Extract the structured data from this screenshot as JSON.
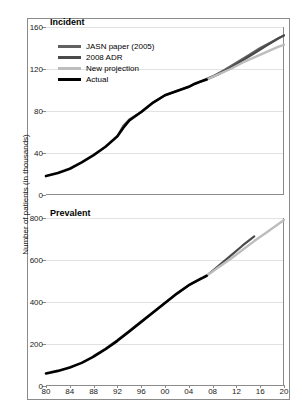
{
  "figure": {
    "ylabel": "Number of patients (in thousands)"
  },
  "legend": {
    "items": [
      {
        "label": "JASN paper (2005)",
        "color": "#616161"
      },
      {
        "label": "2008 ADR",
        "color": "#4a4a4a"
      },
      {
        "label": "New projection",
        "color": "#bdbdbd"
      },
      {
        "label": "Actual",
        "color": "#000000"
      }
    ]
  },
  "chart_data": [
    {
      "type": "line",
      "title": "Incident",
      "xlabel": "",
      "ylabel": "Number of patients (in thousands)",
      "xlim": [
        1980,
        2020
      ],
      "ylim": [
        0,
        160
      ],
      "grid": true,
      "legend_position": "upper-left",
      "xticks": [
        "80",
        "84",
        "88",
        "92",
        "96",
        "00",
        "04",
        "08",
        "12",
        "16",
        "20"
      ],
      "xtick_values": [
        1980,
        1984,
        1988,
        1992,
        1996,
        2000,
        2004,
        2008,
        2012,
        2016,
        2020
      ],
      "yticks": [
        "0",
        "40",
        "80",
        "120",
        "160"
      ],
      "ytick_values": [
        0,
        40,
        80,
        120,
        160
      ],
      "series": [
        {
          "name": "Actual",
          "color": "#000000",
          "width": 2.6,
          "x": [
            1980,
            1982,
            1984,
            1986,
            1988,
            1990,
            1992,
            1993,
            1994,
            1996,
            1998,
            2000,
            2002,
            2004,
            2005,
            2006,
            2007
          ],
          "values": [
            18,
            21,
            25,
            31,
            38,
            46,
            56,
            64,
            71,
            79,
            88,
            95,
            99,
            103,
            106,
            108,
            110
          ]
        },
        {
          "name": "JASN paper (2005)",
          "color": "#616161",
          "width": 2.2,
          "x": [
            1992,
            1993,
            1994,
            1996,
            1998,
            2000,
            2002,
            2004,
            2006,
            2008,
            2010,
            2012,
            2014,
            2016,
            2018,
            2020
          ],
          "values": [
            56,
            66,
            72,
            79,
            88,
            95,
            99,
            103,
            108,
            113,
            119,
            126,
            133,
            140,
            146,
            152
          ]
        },
        {
          "name": "2008 ADR",
          "color": "#4a4a4a",
          "width": 2.2,
          "x": [
            2007,
            2009,
            2011,
            2013,
            2015,
            2017,
            2019,
            2020
          ],
          "values": [
            110,
            115,
            121,
            128,
            135,
            142,
            149,
            152
          ]
        },
        {
          "name": "New projection",
          "color": "#bdbdbd",
          "width": 2.4,
          "x": [
            2007,
            2009,
            2011,
            2013,
            2015,
            2017,
            2019,
            2020
          ],
          "values": [
            110,
            115,
            120,
            126,
            131,
            136,
            141,
            143
          ]
        }
      ]
    },
    {
      "type": "line",
      "title": "Prevalent",
      "xlabel": "",
      "ylabel": "Number of patients (in thousands)",
      "xlim": [
        1980,
        2020
      ],
      "ylim": [
        0,
        800
      ],
      "grid": true,
      "legend_position": "none",
      "xticks": [
        "80",
        "84",
        "88",
        "92",
        "96",
        "00",
        "04",
        "08",
        "12",
        "16",
        "20"
      ],
      "xtick_values": [
        1980,
        1984,
        1988,
        1992,
        1996,
        2000,
        2004,
        2008,
        2012,
        2016,
        2020
      ],
      "yticks": [
        "0",
        "200",
        "400",
        "600",
        "800"
      ],
      "ytick_values": [
        0,
        200,
        400,
        600,
        800
      ],
      "series": [
        {
          "name": "Actual",
          "color": "#000000",
          "width": 2.6,
          "x": [
            1980,
            1982,
            1984,
            1986,
            1988,
            1990,
            1992,
            1994,
            1996,
            1998,
            2000,
            2002,
            2004,
            2006,
            2007
          ],
          "values": [
            60,
            72,
            88,
            110,
            140,
            175,
            215,
            260,
            305,
            350,
            395,
            440,
            480,
            510,
            525
          ]
        },
        {
          "name": "JASN paper (2005)",
          "color": "#616161",
          "width": 2.2,
          "x": [
            1988,
            1990,
            1992,
            1994,
            1996,
            1998,
            2000,
            2002,
            2004,
            2006
          ],
          "values": [
            143,
            178,
            218,
            263,
            308,
            352,
            396,
            440,
            480,
            512
          ]
        },
        {
          "name": "2008 ADR",
          "color": "#4a4a4a",
          "width": 2.2,
          "x": [
            2007,
            2009,
            2011,
            2013,
            2015
          ],
          "values": [
            525,
            572,
            620,
            668,
            712
          ]
        },
        {
          "name": "New projection",
          "color": "#bdbdbd",
          "width": 2.4,
          "x": [
            2007,
            2009,
            2011,
            2013,
            2015,
            2017,
            2019,
            2020
          ],
          "values": [
            525,
            565,
            605,
            648,
            690,
            730,
            770,
            790
          ]
        }
      ]
    }
  ]
}
